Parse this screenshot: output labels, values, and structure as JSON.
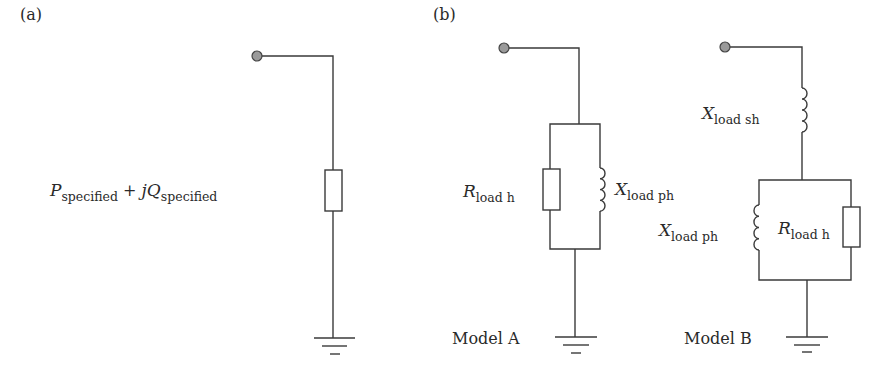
{
  "panels": {
    "a": {
      "label": "(a)",
      "load_expression": {
        "p_symbol": "P",
        "p_subscript": "specified",
        "plus": " + ",
        "q_symbol": "jQ",
        "q_subscript": "specified"
      },
      "components": [
        "source-node",
        "resistor",
        "ground"
      ]
    },
    "b": {
      "label": "(b)",
      "model_a": {
        "caption": "Model A",
        "resistor_label": {
          "symbol": "R",
          "subscript": "load h"
        },
        "inductor_label": {
          "symbol": "X",
          "subscript": "load ph"
        },
        "topology": "parallel R and X to ground"
      },
      "model_b": {
        "caption": "Model B",
        "series_inductor_label": {
          "symbol": "X",
          "subscript": "load sh"
        },
        "inductor_label": {
          "symbol": "X",
          "subscript": "load ph"
        },
        "resistor_label": {
          "symbol": "R",
          "subscript": "load h"
        },
        "topology": "series X then parallel X and R to ground"
      }
    }
  },
  "colors": {
    "wire": "#3a3a3a",
    "node_fill": "#9a9a9a",
    "background": "#ffffff"
  }
}
